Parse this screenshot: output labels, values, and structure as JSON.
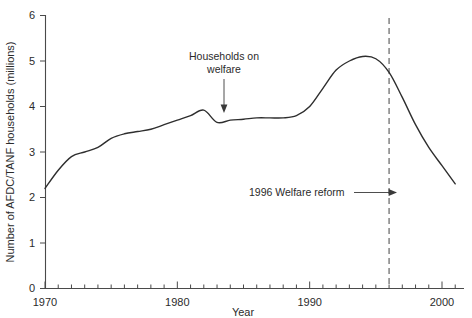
{
  "chart_data": {
    "type": "line",
    "title": "",
    "xlabel": "Year",
    "ylabel": "Number of AFDC/TANF households (millions)",
    "xlim": [
      1970,
      2001
    ],
    "ylim": [
      0,
      6
    ],
    "grid": false,
    "legend": "none",
    "x_tick_labels": [
      "1970",
      "1980",
      "1990",
      "2000"
    ],
    "x_tick_values": [
      1970,
      1980,
      1990,
      2000
    ],
    "x_minor_tick_interval": 1,
    "y_tick_labels": [
      "0",
      "1",
      "2",
      "3",
      "4",
      "5",
      "6"
    ],
    "y_tick_values": [
      0,
      1,
      2,
      3,
      4,
      5,
      6
    ],
    "series": [
      {
        "name": "Households on welfare",
        "color": "#2e2e2e",
        "x": [
          1970,
          1971,
          1972,
          1973,
          1974,
          1975,
          1976,
          1977,
          1978,
          1979,
          1980,
          1981,
          1982,
          1983,
          1984,
          1985,
          1986,
          1987,
          1988,
          1989,
          1990,
          1991,
          1992,
          1993,
          1994,
          1995,
          1996,
          1997,
          1998,
          1999,
          2000,
          2001
        ],
        "values": [
          2.2,
          2.6,
          2.9,
          3.0,
          3.1,
          3.3,
          3.4,
          3.45,
          3.5,
          3.6,
          3.7,
          3.8,
          3.92,
          3.65,
          3.7,
          3.72,
          3.75,
          3.75,
          3.75,
          3.8,
          4.0,
          4.4,
          4.8,
          5.0,
          5.1,
          5.05,
          4.75,
          4.2,
          3.6,
          3.1,
          2.7,
          2.3
        ]
      }
    ],
    "annotations": [
      {
        "id": "households-on-welfare",
        "text_line1": "Households on",
        "text_line2": "welfare",
        "target_x": 1983,
        "target_y": 3.68,
        "arrow": "down"
      },
      {
        "id": "welfare-reform-1996",
        "text": "1996 Welfare reform",
        "target_x": 1996,
        "arrow": "right"
      }
    ],
    "reference_lines": [
      {
        "id": "welfare-reform-marker",
        "x": 1996,
        "style": "dashed",
        "color": "#555555"
      }
    ]
  }
}
